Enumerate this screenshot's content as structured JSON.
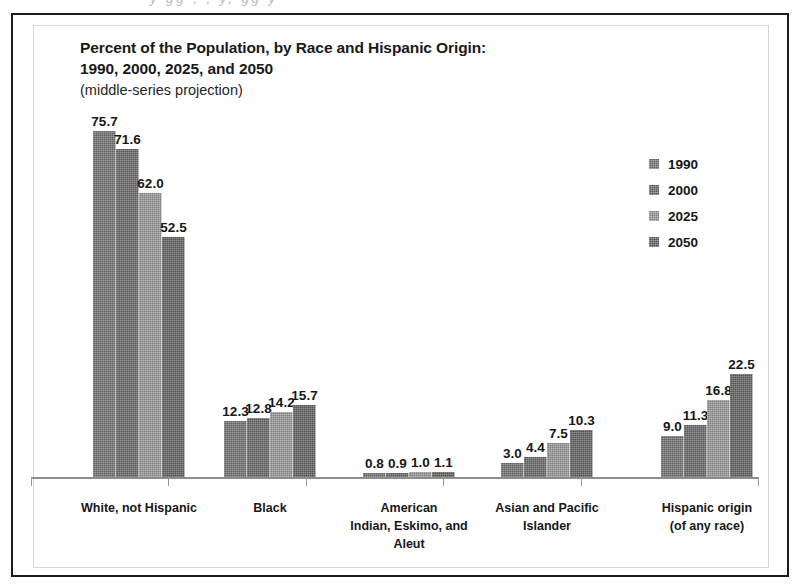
{
  "figure": {
    "title_lines": [
      "Percent of the Population, by Race and Hispanic Origin:",
      "1990, 2000, 2025, and 2050"
    ],
    "subtitle": "(middle-series projection)",
    "scan_artifact": "y gg , , y, gg y"
  },
  "legend": {
    "position": "top-right",
    "entries": [
      {
        "label": "1990",
        "color": "#787878"
      },
      {
        "label": "2000",
        "color": "#6d6d6d"
      },
      {
        "label": "2025",
        "color": "#9d9d9d"
      },
      {
        "label": "2050",
        "color": "#666666"
      }
    ]
  },
  "chart_data": {
    "type": "bar",
    "title": "Percent of the Population, by Race and Hispanic Origin: 1990, 2000, 2025, and 2050",
    "subtitle": "(middle-series projection)",
    "xlabel": "",
    "ylabel": "Percent of the Population",
    "ylim": [
      0,
      80
    ],
    "grid": false,
    "legend_position": "top-right",
    "categories": [
      "White, not Hispanic",
      "Black",
      "American Indian, Eskimo, and Aleut",
      "Asian and Pacific Islander",
      "Hispanic origin (of any race)"
    ],
    "category_label_lines": [
      [
        "White, not Hispanic"
      ],
      [
        "Black"
      ],
      [
        "American",
        "Indian, Eskimo, and",
        "Aleut"
      ],
      [
        "Asian and Pacific",
        "Islander"
      ],
      [
        "Hispanic origin",
        "(of any race)"
      ]
    ],
    "series": [
      {
        "name": "1990",
        "color": "#787878",
        "values": [
          75.7,
          12.3,
          0.8,
          3.0,
          9.0
        ]
      },
      {
        "name": "2000",
        "color": "#6d6d6d",
        "values": [
          71.6,
          12.8,
          0.9,
          4.4,
          11.3
        ]
      },
      {
        "name": "2025",
        "color": "#9d9d9d",
        "values": [
          62.0,
          14.2,
          1.0,
          7.5,
          16.8
        ]
      },
      {
        "name": "2050",
        "color": "#666666",
        "values": [
          52.5,
          15.7,
          1.1,
          10.3,
          22.5
        ]
      }
    ],
    "data_labels": [
      [
        "75.7",
        "71.6",
        "62.0",
        "52.5"
      ],
      [
        "12.3",
        "12.8",
        "14.2",
        "15.7"
      ],
      [
        "0.8",
        "0.9",
        "1.0",
        "1.1"
      ],
      [
        "3.0",
        "4.4",
        "7.5",
        "10.3"
      ],
      [
        "9.0",
        "11.3",
        "16.8",
        "22.5"
      ]
    ]
  },
  "layout": {
    "group_starts": [
      62,
      193,
      332,
      470,
      630
    ],
    "bar_width": 23,
    "group_span": 92,
    "plot_height": 366,
    "y_max": 80,
    "tick_x": [
      18,
      155,
      293,
      430,
      568,
      745
    ]
  }
}
